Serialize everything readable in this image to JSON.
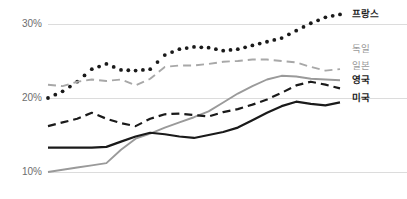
{
  "chart_data": {
    "type": "line",
    "title": "",
    "subtitle": "",
    "xlabel": "",
    "ylabel": "",
    "ylim": [
      8.5,
      32.5
    ],
    "yticks": [
      10,
      20,
      30
    ],
    "ytick_labels": [
      "10%",
      "20%",
      "30%"
    ],
    "grid": true,
    "grid_axis": "y",
    "legend_position": "right-inline",
    "x": [
      0,
      1,
      2,
      3,
      4,
      5,
      6,
      7,
      8,
      9,
      10,
      11,
      12,
      13,
      14,
      15,
      16,
      17,
      18,
      19,
      20
    ],
    "x_tick_labels": [],
    "series": [
      {
        "name": "프랑스",
        "style": "dotted",
        "color": "#1a1a1a",
        "label_weight": "bold",
        "values": [
          20.0,
          20.9,
          22.2,
          23.9,
          24.6,
          23.8,
          23.7,
          23.9,
          25.8,
          26.6,
          26.9,
          26.8,
          26.4,
          26.6,
          27.1,
          27.6,
          28.1,
          29.1,
          30.1,
          30.9,
          31.3
        ]
      },
      {
        "name": "독일",
        "style": "dashed",
        "color": "#a8a8a8",
        "label_weight": "light",
        "values": [
          21.8,
          21.6,
          22.2,
          22.5,
          22.3,
          22.5,
          21.7,
          22.6,
          24.2,
          24.4,
          24.4,
          24.6,
          24.9,
          25.0,
          25.2,
          25.2,
          25.0,
          24.8,
          24.2,
          23.7,
          23.9
        ]
      },
      {
        "name": "일본",
        "style": "solid",
        "color": "#9a9a9a",
        "label_weight": "light",
        "values": [
          10.0,
          10.3,
          10.6,
          10.9,
          11.2,
          13.0,
          14.5,
          15.2,
          16.0,
          16.7,
          17.4,
          18.2,
          19.4,
          20.6,
          21.6,
          22.5,
          23.0,
          22.9,
          22.6,
          22.5,
          22.4
        ]
      },
      {
        "name": "영국",
        "style": "dashed",
        "color": "#1a1a1a",
        "label_weight": "bold",
        "values": [
          16.2,
          16.7,
          17.2,
          18.0,
          17.2,
          16.6,
          16.2,
          17.2,
          17.8,
          17.9,
          17.7,
          17.5,
          18.1,
          18.5,
          19.1,
          19.8,
          20.7,
          21.7,
          22.2,
          21.8,
          21.3
        ]
      },
      {
        "name": "미국",
        "style": "solid",
        "color": "#1a1a1a",
        "label_weight": "bold",
        "values": [
          13.3,
          13.3,
          13.3,
          13.3,
          13.4,
          14.1,
          14.8,
          15.3,
          15.1,
          14.8,
          14.6,
          15.0,
          15.4,
          16.0,
          17.0,
          18.0,
          18.9,
          19.5,
          19.2,
          19.0,
          19.4
        ]
      }
    ],
    "legend_labels": [
      {
        "text": "프랑스",
        "weight": "bold",
        "color": "#1a1a1a",
        "y_value": 31.3
      },
      {
        "text": "독일",
        "weight": "light",
        "color": "#9a9a9a",
        "y_value": 26.6
      },
      {
        "text": "일본",
        "weight": "light",
        "color": "#9a9a9a",
        "y_value": 24.3
      },
      {
        "text": "영국",
        "weight": "bold",
        "color": "#1a1a1a",
        "y_value": 22.4
      },
      {
        "text": "미국",
        "weight": "bold",
        "color": "#1a1a1a",
        "y_value": 19.9
      }
    ],
    "colors": {
      "gridline": "#dcdcdc",
      "axis_text": "#6d6d6d",
      "dark_series": "#1a1a1a",
      "light_series": "#9a9a9a",
      "background": "#ffffff"
    }
  }
}
